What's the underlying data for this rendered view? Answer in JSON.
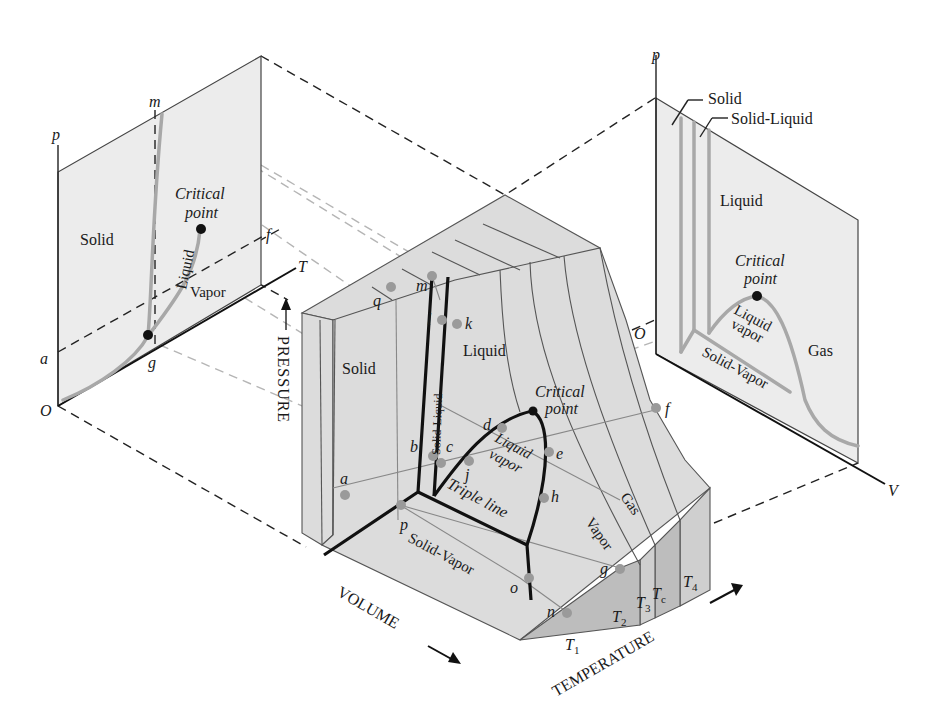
{
  "figure": {
    "colors": {
      "surface": "#dcdcdc",
      "panel": "#ececec",
      "curve": "#a8a8a8",
      "phase_line": "#111111",
      "state_point": "#9a9a9a"
    }
  },
  "left_panel": {
    "name": "p-T phase diagram",
    "axis_p": "p",
    "axis_T": "T",
    "origin": "O",
    "points": {
      "a": "a",
      "f": "f",
      "g": "g",
      "m": "m"
    },
    "regions": {
      "solid": "Solid",
      "liquid": "Liquid",
      "vapor": "Vapor"
    },
    "critical_point": {
      "line1": "Critical",
      "line2": "point"
    }
  },
  "right_panel": {
    "name": "p-v diagram",
    "axis_p": "p",
    "axis_V": "V",
    "origin": "O",
    "callouts": {
      "solid": "Solid",
      "solid_liquid": "Solid-Liquid"
    },
    "regions": {
      "liquid": "Liquid",
      "liquid_vapor_1": "Liquid",
      "liquid_vapor_2": "vapor",
      "gas": "Gas",
      "solid_vapor": "Solid-Vapor"
    },
    "critical_point": {
      "line1": "Critical",
      "line2": "point"
    }
  },
  "surface": {
    "axes": {
      "pressure": "PRESSURE",
      "volume": "VOLUME",
      "temperature": "TEMPERATURE"
    },
    "regions": {
      "solid": "Solid",
      "solid_liquid": "Solid-Liquid",
      "liquid": "Liquid",
      "liquid_vapor_1": "Liquid",
      "liquid_vapor_2": "vapor",
      "triple_line": "Triple line",
      "gas": "Gas",
      "vapor": "Vapor",
      "solid_vapor": "Solid-Vapor"
    },
    "critical_point": {
      "line1": "Critical",
      "line2": "point"
    },
    "state_points": [
      "a",
      "b",
      "c",
      "d",
      "e",
      "f",
      "g",
      "h",
      "j",
      "k",
      "l",
      "m",
      "n",
      "o",
      "p",
      "q"
    ],
    "isotherms": {
      "T1": "T",
      "T1_sub": "1",
      "T2": "T",
      "T2_sub": "2",
      "T3": "T",
      "T3_sub": "3",
      "Tc": "T",
      "Tc_sub": "c",
      "T4": "T",
      "T4_sub": "4"
    }
  }
}
